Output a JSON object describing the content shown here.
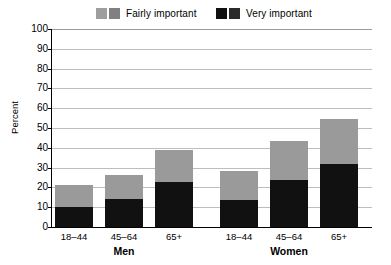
{
  "chart_data": {
    "type": "bar",
    "stacked": true,
    "title": "",
    "xlabel": "",
    "ylabel": "Percent",
    "ylim": [
      0,
      100
    ],
    "ytick_step": 10,
    "yticks": [
      0,
      10,
      20,
      30,
      40,
      50,
      60,
      70,
      80,
      90,
      100
    ],
    "ytick_labels": [
      "0",
      "10",
      "20",
      "30",
      "40",
      "50",
      "60",
      "70",
      "80",
      "90",
      "100"
    ],
    "grid": true,
    "legend_position": "top",
    "groups": [
      "Men",
      "Women"
    ],
    "categories": [
      "18–44",
      "45–64",
      "65+",
      "18–44",
      "45–64",
      "65+"
    ],
    "group_of_category": [
      "Men",
      "Men",
      "Men",
      "Women",
      "Women",
      "Women"
    ],
    "series": [
      {
        "name": "Very important",
        "color": "#111111",
        "values": [
          10,
          14,
          22.5,
          13.5,
          23.5,
          32
        ]
      },
      {
        "name": "Fairly important",
        "color": "#9a9a9a",
        "values": [
          11,
          12.5,
          16.5,
          15,
          20,
          22.5
        ]
      }
    ],
    "totals": [
      21,
      26.5,
      39,
      28.5,
      43.5,
      54.5
    ]
  },
  "legend": {
    "entries": [
      {
        "label": "Fairly important",
        "swatch_light": "#9e9e9e",
        "swatch_dark": "#808080"
      },
      {
        "label": "Very important",
        "swatch_light": "#111111",
        "swatch_dark": "#2b2b2b"
      }
    ]
  },
  "axes": {
    "y_title": "Percent",
    "y_labels": [
      "100",
      "90",
      "80",
      "70",
      "60",
      "50",
      "40",
      "30",
      "20",
      "10",
      "0"
    ],
    "x_labels": [
      "18–44",
      "45–64",
      "65+",
      "18–44",
      "45–64",
      "65+"
    ],
    "group_labels": [
      "Men",
      "Women"
    ]
  },
  "colors": {
    "very_important": "#111111",
    "fairly_important": "#9a9a9a",
    "gridline": "#bdbdbd",
    "axis": "#000000",
    "background": "#ffffff"
  }
}
